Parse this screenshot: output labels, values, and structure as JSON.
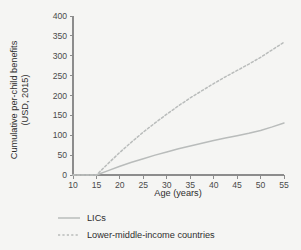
{
  "chart_data": {
    "type": "line",
    "title": "",
    "xlabel": "Age (years)",
    "ylabel": "Cumulative per-child benefits (USD, 2015)",
    "ylabel_line1": "Cumulative per-child benefits",
    "ylabel_line2": "(USD, 2015)",
    "xlim": [
      10,
      55
    ],
    "ylim": [
      0,
      400
    ],
    "xticks": [
      10,
      15,
      20,
      25,
      30,
      35,
      40,
      45,
      50,
      55
    ],
    "xtick_labels": [
      "10",
      "15",
      "20",
      "25",
      "30",
      "35",
      "40",
      "45",
      "50",
      "55"
    ],
    "yticks": [
      0,
      50,
      100,
      150,
      200,
      250,
      300,
      350,
      400
    ],
    "ytick_labels": [
      "0",
      "50",
      "100",
      "150",
      "200",
      "250",
      "300",
      "350",
      "400"
    ],
    "grid": false,
    "legend_position": "bottom",
    "x": [
      10,
      15,
      17.5,
      20,
      22.5,
      25,
      27.5,
      30,
      32.5,
      35,
      37.5,
      40,
      42.5,
      45,
      47.5,
      50,
      52.5,
      55
    ],
    "series": [
      {
        "name": "LICs",
        "style": "solid",
        "color": "#b9bcbb",
        "values": [
          0,
          0,
          11,
          22,
          32,
          41,
          50,
          58,
          66,
          73,
          80,
          87,
          93,
          99,
          105,
          112,
          121,
          131
        ]
      },
      {
        "name": "Lower-middle-income countries",
        "style": "dashed",
        "color": "#b9bcbb",
        "values": [
          0,
          0,
          29,
          57,
          83,
          108,
          131,
          153,
          174,
          194,
          212,
          230,
          247,
          263,
          279,
          296,
          315,
          334
        ]
      }
    ],
    "legend": [
      {
        "label": "LICs",
        "style": "solid",
        "color": "#b9bcbb"
      },
      {
        "label": "Lower-middle-income countries",
        "style": "dashed",
        "color": "#b9bcbb"
      }
    ],
    "colors": {
      "background": "#f5f5f3",
      "axis": "#8c8c8c",
      "text": "#2e2e2e",
      "series": "#b9bcbb"
    }
  }
}
